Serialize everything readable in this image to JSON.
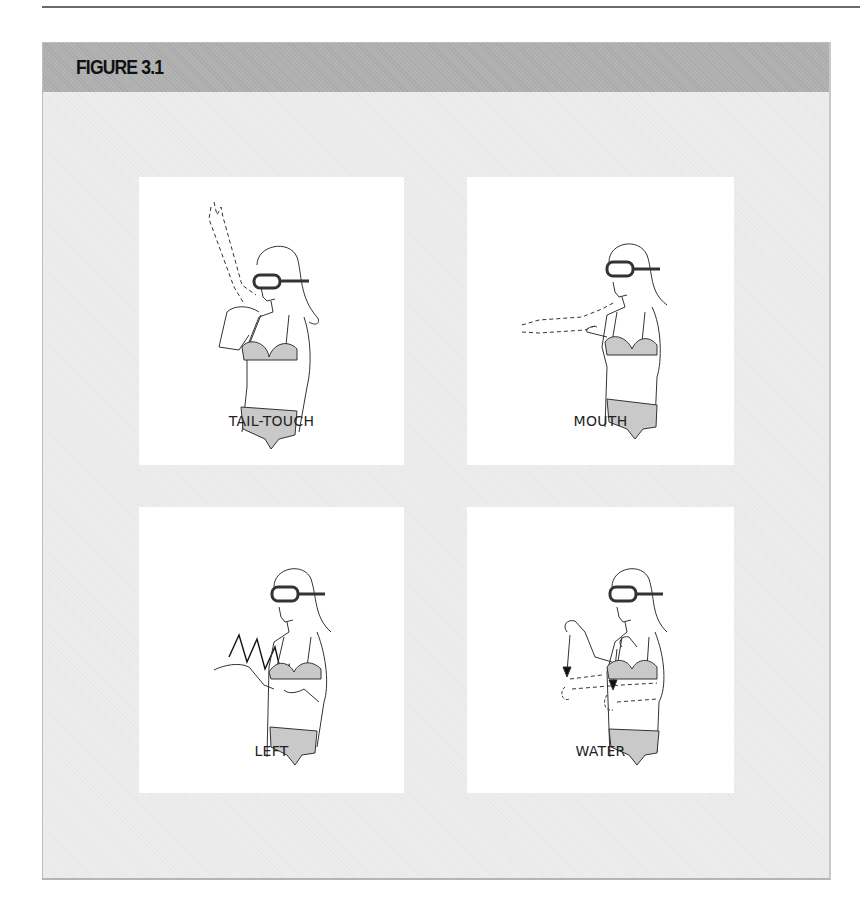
{
  "figure": {
    "title": "FIGURE 3.1",
    "panels": [
      {
        "id": "tail-touch",
        "caption": "TAIL-TOUCH",
        "gesture": "hand touches opposite shoulder; dashed arm raised upward"
      },
      {
        "id": "mouth",
        "caption": "MOUTH",
        "gesture": "hand near chest; dashed arm extended outward horizontally"
      },
      {
        "id": "left",
        "caption": "LEFT",
        "gesture": "zig-zag motion across body with open palm"
      },
      {
        "id": "water",
        "caption": "WATER",
        "gesture": "both hands move downward with arrows; dashed circular motion"
      }
    ]
  },
  "colors": {
    "header_bg": "#b3b3b3",
    "frame_bg": "#ededed",
    "panel_bg": "#ffffff",
    "line": "#333333",
    "shading": "#c9c9c9"
  }
}
